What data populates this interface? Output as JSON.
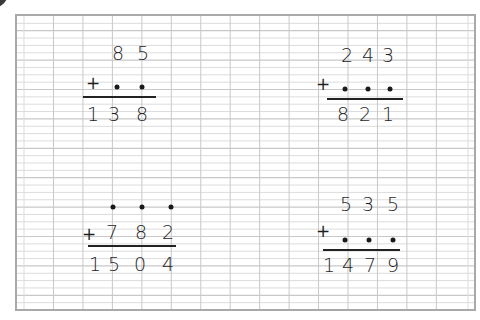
{
  "worksheet": {
    "type": "column-addition-missing-addend",
    "problems": [
      {
        "id": "top-left",
        "first_addend": [
          "8",
          "5"
        ],
        "operator": "+",
        "second_addend_missing_digits": 2,
        "sum": [
          "1",
          "3",
          "8"
        ]
      },
      {
        "id": "top-right",
        "first_addend": [
          "2",
          "4",
          "3"
        ],
        "operator": "+",
        "second_addend_missing_digits": 3,
        "sum": [
          "8",
          "2",
          "1"
        ]
      },
      {
        "id": "bottom-left",
        "first_addend_missing_digits": 3,
        "operator": "+",
        "second_addend": [
          "7",
          "8",
          "2"
        ],
        "sum": [
          "1",
          "5",
          "0",
          "4"
        ]
      },
      {
        "id": "bottom-right",
        "first_addend": [
          "5",
          "3",
          "5"
        ],
        "operator": "+",
        "second_addend_missing_digits": 3,
        "sum": [
          "1",
          "4",
          "7",
          "9"
        ]
      }
    ]
  },
  "colors": {
    "ink": "#1e1e1e",
    "grid_line": "#dcdcdc",
    "grid_line_strong": "#c8c8c8",
    "border": "#a9a9a9"
  }
}
